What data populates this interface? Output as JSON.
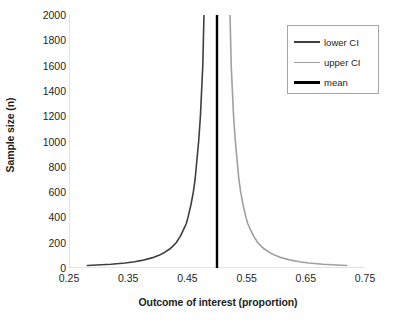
{
  "chart_data": {
    "type": "line",
    "title": "",
    "xlabel": "Outcome of interest (proportion)",
    "ylabel": "Sample size (n)",
    "xlim": [
      0.25,
      0.75
    ],
    "ylim": [
      0,
      2000
    ],
    "xticks": [
      "0.25",
      "0.35",
      "0.45",
      "0.55",
      "0.65",
      "0.75"
    ],
    "xtick_values": [
      0.25,
      0.35,
      0.45,
      0.55,
      0.65,
      0.75
    ],
    "yticks": [
      "0",
      "200",
      "400",
      "600",
      "800",
      "1000",
      "1200",
      "1400",
      "1600",
      "1800",
      "2000"
    ],
    "ytick_values": [
      0,
      200,
      400,
      600,
      800,
      1000,
      1200,
      1400,
      1600,
      1800,
      2000
    ],
    "grid": false,
    "legend_position": "top-right",
    "orientation": "sample-size-on-y-axis",
    "series": [
      {
        "name": "lower CI",
        "color": "#3f3f3f",
        "width": 1.6,
        "n": [
          20,
          30,
          40,
          50,
          60,
          80,
          100,
          125,
          150,
          175,
          200,
          250,
          300,
          350,
          400,
          500,
          600,
          700,
          800,
          900,
          1000,
          1200,
          1400,
          1600,
          1800,
          2000
        ],
        "proportion": [
          0.281,
          0.321,
          0.345,
          0.361,
          0.373,
          0.39,
          0.402,
          0.412,
          0.42,
          0.426,
          0.431,
          0.438,
          0.443,
          0.448,
          0.451,
          0.456,
          0.46,
          0.463,
          0.465,
          0.467,
          0.469,
          0.472,
          0.474,
          0.476,
          0.477,
          0.478
        ]
      },
      {
        "name": "upper CI",
        "color": "#a0a0a0",
        "width": 1.6,
        "n": [
          20,
          30,
          40,
          50,
          60,
          80,
          100,
          125,
          150,
          175,
          200,
          250,
          300,
          350,
          400,
          500,
          600,
          700,
          800,
          900,
          1000,
          1200,
          1400,
          1600,
          1800,
          2000
        ],
        "proportion": [
          0.719,
          0.679,
          0.655,
          0.639,
          0.627,
          0.61,
          0.598,
          0.588,
          0.58,
          0.574,
          0.569,
          0.562,
          0.557,
          0.552,
          0.549,
          0.544,
          0.54,
          0.537,
          0.535,
          0.533,
          0.531,
          0.528,
          0.526,
          0.524,
          0.523,
          0.522
        ]
      },
      {
        "name": "mean",
        "color": "#000000",
        "width": 2.4,
        "n": [
          0,
          2000
        ],
        "proportion": [
          0.5,
          0.5
        ]
      }
    ]
  },
  "legend": {
    "items": [
      {
        "label": "lower CI",
        "color": "#3f3f3f",
        "thickness": 2
      },
      {
        "label": "upper CI",
        "color": "#a0a0a0",
        "thickness": 1.6
      },
      {
        "label": "mean",
        "color": "#000000",
        "thickness": 3
      }
    ]
  },
  "axes": {
    "line_color": "#c9c9c9",
    "tick_color": "#c9c9c9",
    "text_color": "#231f20"
  }
}
